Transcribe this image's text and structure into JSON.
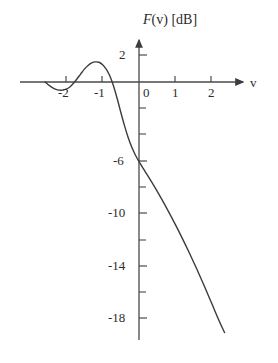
{
  "chart_data": {
    "type": "line",
    "title": "F(v) [dB]",
    "title_parts": {
      "func": "F",
      "arg": "(v)",
      "unit": "[dB]"
    },
    "xlabel": "v",
    "ylabel": "F(v) [dB]",
    "xlim": [
      -2.85,
      2.65
    ],
    "ylim": [
      -20.5,
      3.2
    ],
    "grid": false,
    "legend": null,
    "x_ticks": [
      -2,
      -1,
      0,
      1,
      2
    ],
    "x_tick_labels": [
      "-2",
      "-1",
      "0",
      "1",
      "2"
    ],
    "y_ticks": [
      2,
      -6,
      -10,
      -14,
      -18
    ],
    "y_tick_labels": [
      "2",
      "-6",
      "-10",
      "-14",
      "-18"
    ],
    "y_minor_ticks": [
      0,
      -2,
      -4,
      -8,
      -12,
      -16,
      -20
    ],
    "series": [
      {
        "name": "F(v)",
        "color": "#3c3c3c",
        "x": [
          -2.58,
          -2.45,
          -2.32,
          -2.2,
          -2.1,
          -2.0,
          -1.9,
          -1.8,
          -1.7,
          -1.6,
          -1.5,
          -1.4,
          -1.3,
          -1.2,
          -1.1,
          -1.0,
          -0.9,
          -0.8,
          -0.7,
          -0.6,
          -0.5,
          -0.4,
          -0.3,
          -0.2,
          -0.1,
          0.0,
          0.2,
          0.4,
          0.6,
          0.8,
          1.0,
          1.2,
          1.4,
          1.6,
          1.8,
          2.0,
          2.2,
          2.35
        ],
        "y": [
          0.0,
          -0.3,
          -0.52,
          -0.62,
          -0.62,
          -0.55,
          -0.38,
          -0.1,
          0.25,
          0.62,
          0.98,
          1.26,
          1.45,
          1.53,
          1.5,
          1.32,
          0.98,
          0.45,
          -0.3,
          -1.25,
          -2.3,
          -3.3,
          -4.2,
          -4.95,
          -5.55,
          -6.05,
          -6.95,
          -7.85,
          -8.8,
          -9.8,
          -10.85,
          -11.95,
          -13.1,
          -14.3,
          -15.55,
          -16.85,
          -18.15,
          -19.05
        ]
      }
    ],
    "annotations": {
      "peak_value": 1.53,
      "peak_at": -1.2,
      "value_at_zero": -6.05,
      "zero_crossing": -0.73,
      "dip_value": -0.62,
      "dip_at": -2.15
    }
  },
  "axes": {
    "x_axis_name": "v",
    "y_axis_title": "F(v) [dB]"
  }
}
